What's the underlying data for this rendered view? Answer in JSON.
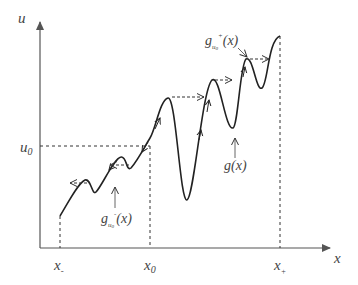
{
  "diagram": {
    "axes": {
      "y_label": "u",
      "x_label": "x",
      "u0_label": "u",
      "u0_sub": "0"
    },
    "x_ticks": [
      {
        "main": "x",
        "sub": "-"
      },
      {
        "main": "x",
        "sub": "0"
      },
      {
        "main": "x",
        "sub": "+"
      }
    ],
    "annotations": {
      "g_upper": {
        "main": "g",
        "sub": "u",
        "subsub": "0",
        "sup": "+",
        "arg": "(x)"
      },
      "g_lower": {
        "main": "g",
        "sub": "u",
        "subsub": "0",
        "sup": "-",
        "arg": "(x)"
      },
      "g_curve": "g(x)"
    },
    "colors": {
      "curve": "#222222",
      "axis": "#555555",
      "dashed": "#333333",
      "label": "#444444"
    }
  }
}
